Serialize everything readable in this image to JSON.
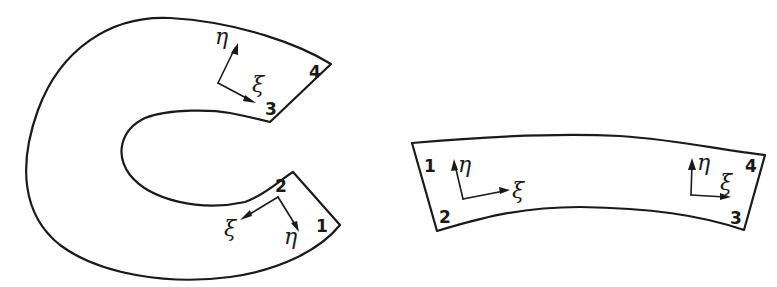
{
  "figure": {
    "left_domain": {
      "description": "Curved C-shaped element (physical domain)",
      "nodes": [
        {
          "id": "1",
          "label": "1"
        },
        {
          "id": "2",
          "label": "2"
        },
        {
          "id": "3",
          "label": "3"
        },
        {
          "id": "4",
          "label": "4"
        }
      ],
      "axes_top": {
        "xi": "ξ",
        "eta": "η"
      },
      "axes_bottom": {
        "xi": "ξ",
        "eta": "η"
      }
    },
    "right_domain": {
      "description": "Mapped / straightened curved strip element",
      "nodes": [
        {
          "id": "1",
          "label": "1"
        },
        {
          "id": "2",
          "label": "2"
        },
        {
          "id": "3",
          "label": "3"
        },
        {
          "id": "4",
          "label": "4"
        }
      ],
      "axes_left": {
        "xi": "ξ",
        "eta": "η"
      },
      "axes_right": {
        "xi": "ξ",
        "eta": "η"
      }
    },
    "colors": {
      "stroke": "#1a1a1a",
      "background": "#ffffff"
    }
  }
}
